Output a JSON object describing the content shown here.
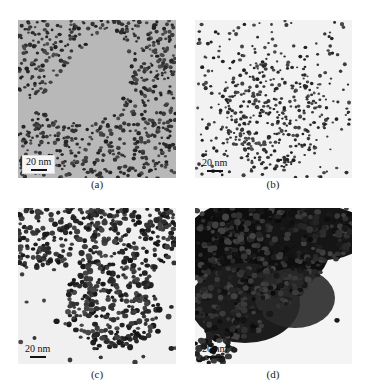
{
  "figure": {
    "panels": [
      {
        "id": "a",
        "caption": "(a)",
        "scale_bar": "20 nm",
        "background": "#b8b8b8",
        "description": "sparse nanoparticle network on grey background"
      },
      {
        "id": "b",
        "caption": "(b)",
        "scale_bar": "20 nm",
        "background": "#f2f2f2",
        "description": "dispersed nanoparticles with denser central cluster on light background"
      },
      {
        "id": "c",
        "caption": "(c)",
        "scale_bar": "20 nm",
        "background": "#f0f0f0",
        "description": "dense aggregated larger nanoparticles"
      },
      {
        "id": "d",
        "caption": "(d)",
        "scale_bar": "20 nm",
        "background": "#f4f4f4",
        "description": "heavily agglomerated dark nanoparticle mass"
      }
    ]
  }
}
